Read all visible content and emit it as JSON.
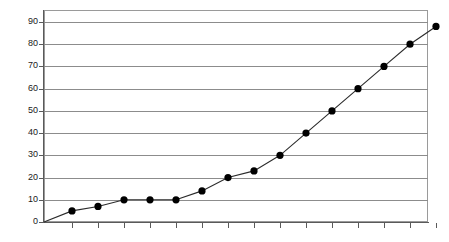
{
  "chart_data": {
    "type": "line",
    "title": "",
    "subtitle": "",
    "xlabel": "",
    "ylabel": "",
    "ylim": [
      0,
      90
    ],
    "xlim": [
      0,
      15
    ],
    "y_ticks": [
      0,
      10,
      20,
      30,
      40,
      50,
      60,
      70,
      80,
      90
    ],
    "y_tick_labels": [
      "0",
      "10",
      "20",
      "30",
      "40",
      "50",
      "60",
      "70",
      "80",
      "90"
    ],
    "x_tick_labels": [],
    "x_tick_count": 15,
    "grid": "horizontal",
    "legend": "none",
    "marker": "filled-circle",
    "series": [
      {
        "name": "series-1",
        "x": [
          1,
          2,
          3,
          4,
          5,
          6,
          7,
          8,
          9,
          10,
          11,
          12,
          13,
          14,
          15
        ],
        "values": [
          5,
          7,
          10,
          10,
          10,
          14,
          20,
          23,
          30,
          40,
          50,
          60,
          70,
          80,
          88
        ]
      }
    ],
    "colors": {
      "line": "#2b2b2b",
      "marker": "#000000",
      "grid": "#8c8c8c",
      "axis": "#5a5a5a",
      "frame": "#9a9a9a",
      "background": "#ffffff",
      "text": "#1a1a1a"
    }
  }
}
